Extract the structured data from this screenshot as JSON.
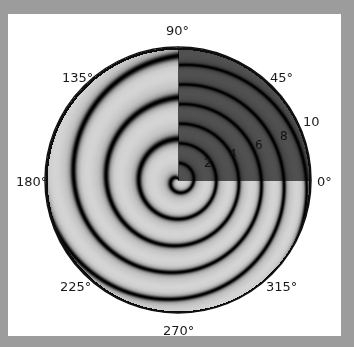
{
  "chart_data": {
    "type": "polar-heatmap",
    "title": "",
    "angular_ticks": [
      "0°",
      "45°",
      "90°",
      "135°",
      "180°",
      "225°",
      "270°",
      "315°"
    ],
    "radial_ticks": [
      "2",
      "4",
      "6",
      "8",
      "10"
    ],
    "rlim": [
      0,
      10.5
    ],
    "colormap": "grayscale",
    "center_px": [
      178,
      180
    ],
    "radius_px": 133,
    "highlight_quadrant_deg": [
      0,
      90
    ]
  },
  "labels": {
    "a0": "0°",
    "a45": "45°",
    "a90": "90°",
    "a135": "135°",
    "a180": "180°",
    "a225": "225°",
    "a270": "270°",
    "a315": "315°",
    "r2": "2",
    "r4": "4",
    "r6": "6",
    "r8": "8",
    "r10": "10"
  },
  "colors": {
    "background": "#9c9c9c",
    "panel": "#ffffff",
    "ring_dark": "#1e1e1e",
    "ring_light": "#cfcfcf"
  }
}
